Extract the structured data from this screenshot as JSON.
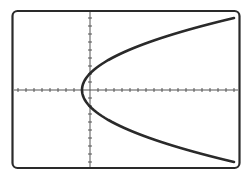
{
  "chart_data": {
    "type": "line",
    "title": "",
    "xlabel": "",
    "ylabel": "",
    "equation_form": "x = a*y^2 + h (parabola opening right)",
    "vertex": {
      "x": -1,
      "y": 0
    },
    "grid": false,
    "axes": {
      "x_ticks_spacing": 1,
      "y_ticks_spacing": 1
    },
    "xlim": [
      -10,
      19
    ],
    "ylim": [
      -10,
      10
    ],
    "series": [
      {
        "name": "parabola",
        "points": [
          {
            "x": 18,
            "y": 9
          },
          {
            "x": 10,
            "y": 6.3
          },
          {
            "x": 5,
            "y": 4.6
          },
          {
            "x": 2,
            "y": 3.2
          },
          {
            "x": 0,
            "y": 2
          },
          {
            "x": -1,
            "y": 0
          },
          {
            "x": 0,
            "y": -2
          },
          {
            "x": 2,
            "y": -3.2
          },
          {
            "x": 5,
            "y": -4.6
          },
          {
            "x": 10,
            "y": -6.3
          },
          {
            "x": 18,
            "y": -9
          }
        ]
      }
    ]
  },
  "colors": {
    "frame": "#2a2a2a",
    "axis": "#555555",
    "curve": "#2a2a2a",
    "background": "#ffffff"
  },
  "accessibility": {
    "label": "Graph of a parabola opening to the right"
  }
}
